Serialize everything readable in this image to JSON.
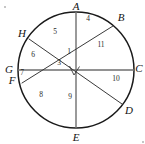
{
  "figure": {
    "kind": "circle-geometry-diagram",
    "width": 145,
    "height": 144,
    "background_color": "#ffffff",
    "stroke_color": "#1a1a1a",
    "chord_color": "#3a3a3a",
    "diameter_color": "#6f6f6f",
    "label_color": "#121212"
  },
  "circle": {
    "center_x": 76,
    "center_y": 70,
    "radius": 58,
    "stroke_width": 1.5
  },
  "points": [
    {
      "id": "A",
      "label": "A",
      "cx": 76,
      "cy": 12,
      "label_x": 76,
      "label_y": 6,
      "on_circle": true
    },
    {
      "id": "B",
      "label": "B",
      "cx": 113,
      "cy": 26,
      "label_x": 121,
      "label_y": 17,
      "on_circle": true
    },
    {
      "id": "C",
      "label": "C",
      "cx": 134,
      "cy": 70,
      "label_x": 139,
      "label_y": 68,
      "on_circle": true
    },
    {
      "id": "D",
      "label": "D",
      "cx": 122,
      "cy": 104,
      "label_x": 129,
      "label_y": 110,
      "on_circle": true
    },
    {
      "id": "E",
      "label": "E",
      "cx": 76,
      "cy": 128,
      "label_x": 76,
      "label_y": 137,
      "on_circle": true
    },
    {
      "id": "F",
      "label": "F",
      "cx": 22,
      "cy": 83,
      "label_x": 12,
      "label_y": 80,
      "on_circle": true
    },
    {
      "id": "G",
      "label": "G",
      "cx": 18,
      "cy": 70,
      "label_x": 9,
      "label_y": 69,
      "on_circle": true
    },
    {
      "id": "H",
      "label": "H",
      "cx": 29,
      "cy": 39,
      "label_x": 22,
      "label_y": 33,
      "on_circle": true
    }
  ],
  "chords": [
    {
      "id": "AE",
      "from": "A",
      "to": "E",
      "kind": "diameter",
      "stroke": "#6f6f6f",
      "stroke_width": 1.4
    },
    {
      "id": "GC",
      "from": "G",
      "to": "C",
      "kind": "diameter",
      "stroke": "#6f6f6f",
      "stroke_width": 1.6
    },
    {
      "id": "HD",
      "from": "H",
      "to": "D",
      "kind": "chord",
      "stroke": "#3a3a3a",
      "stroke_width": 1.0
    },
    {
      "id": "FB",
      "from": "F",
      "to": "B",
      "kind": "chord",
      "stroke": "#3a3a3a",
      "stroke_width": 1.0
    }
  ],
  "right_angle": {
    "at_point": "center",
    "x": 76,
    "y": 70,
    "size": 6,
    "label": "right-angle-mark"
  },
  "region_labels": [
    {
      "id": "1",
      "text": "1",
      "x": 69,
      "y": 52
    },
    {
      "id": "3",
      "text": "3",
      "x": 59,
      "y": 63
    },
    {
      "id": "4",
      "text": "4",
      "x": 88,
      "y": 19
    },
    {
      "id": "5",
      "text": "5",
      "x": 55,
      "y": 32
    },
    {
      "id": "6",
      "text": "6",
      "x": 33,
      "y": 55
    },
    {
      "id": "7",
      "text": "7",
      "x": 22,
      "y": 73
    },
    {
      "id": "8",
      "text": "8",
      "x": 41,
      "y": 95
    },
    {
      "id": "9",
      "text": "9",
      "x": 70,
      "y": 97
    },
    {
      "id": "10",
      "text": "10",
      "x": 116,
      "y": 79
    },
    {
      "id": "11",
      "text": "11",
      "x": 101,
      "y": 45
    }
  ],
  "specks": [
    {
      "x": 4,
      "y": 6
    },
    {
      "x": 142,
      "y": 141
    }
  ]
}
